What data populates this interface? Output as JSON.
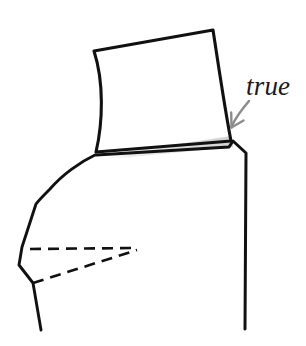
{
  "figure": {
    "kind": "technical-line-drawing",
    "background_color": "#ffffff",
    "stroke_color": "#111111",
    "shade_color": "#e2e2e2",
    "arrow_color": "#8c8c8c",
    "width": 306,
    "height": 346
  },
  "annotations": [
    {
      "id": "true",
      "text": "true",
      "style": "italic",
      "color": "#1a1a1a",
      "font_size_px": 27,
      "x": 246,
      "y": 73,
      "points_to": "upper-right-corner-notch"
    }
  ],
  "arrow": {
    "name": "true-arrow",
    "color": "#8c8c8c",
    "from": [
      249,
      101
    ],
    "to": [
      231,
      127
    ],
    "curved": true
  },
  "shapes": {
    "upper_panel": {
      "name": "upper-panel",
      "description": "quadrilateral with curved left and right edges",
      "corners": {
        "top_left": [
          94,
          51
        ],
        "top_right": [
          213,
          30
        ],
        "bottom_right": [
          231,
          141
        ],
        "bottom_left": [
          96,
          152
        ]
      }
    },
    "shade_band": {
      "name": "shade-band",
      "description": "light gray gradient wedge under the upper panel lower edge",
      "points": [
        [
          97,
          155
        ],
        [
          231,
          138
        ],
        [
          233,
          146
        ],
        [
          99,
          159
        ]
      ]
    },
    "lower_panel": {
      "name": "lower-panel",
      "description": "skirt/body outline below the upper panel",
      "points": [
        [
          96,
          154
        ],
        [
          231,
          146
        ],
        [
          233,
          141
        ],
        [
          246,
          152
        ],
        [
          245,
          329
        ]
      ]
    },
    "left_profile": {
      "name": "left-profile",
      "description": "curved side seam running down the left",
      "points": [
        [
          95,
          155
        ],
        [
          72,
          170
        ],
        [
          52,
          188
        ],
        [
          36,
          204
        ],
        [
          22,
          247
        ],
        [
          19,
          265
        ],
        [
          33,
          283
        ],
        [
          41,
          330
        ]
      ]
    }
  },
  "dashed_lines": [
    {
      "name": "dart-upper-dashed-line",
      "from": [
        30,
        249
      ],
      "to": [
        137,
        248
      ]
    },
    {
      "name": "dart-lower-dashed-line",
      "from": [
        33,
        283
      ],
      "to": [
        137,
        250
      ]
    }
  ]
}
